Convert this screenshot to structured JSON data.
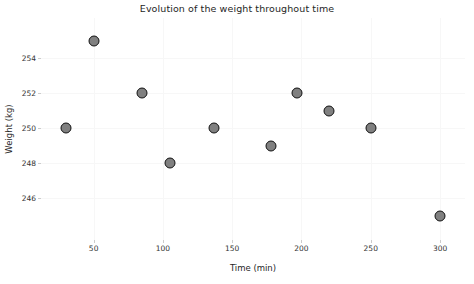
{
  "chart_data": {
    "type": "scatter",
    "title": "Evolution of the weight throughout time",
    "xlabel": "Time (min)",
    "ylabel": "Weight (kg)",
    "xlim": [
      12,
      318
    ],
    "ylim": [
      243.6,
      256.3
    ],
    "xticks": [
      50,
      100,
      150,
      200,
      250,
      300
    ],
    "xtick_labels": [
      "50",
      "100",
      "150",
      "200",
      "250",
      "300"
    ],
    "yticks": [
      246,
      248,
      250,
      252,
      254
    ],
    "ytick_labels": [
      "246",
      "248",
      "250",
      "252",
      "254"
    ],
    "grid": true,
    "legend": null,
    "x": [
      30,
      50,
      85,
      105,
      137,
      178,
      197,
      220,
      250,
      300
    ],
    "y": [
      250,
      255,
      252,
      248,
      250,
      249,
      252,
      251,
      250,
      245
    ],
    "points": [
      {
        "x": 30,
        "y": 250
      },
      {
        "x": 50,
        "y": 255
      },
      {
        "x": 85,
        "y": 252
      },
      {
        "x": 105,
        "y": 248
      },
      {
        "x": 137,
        "y": 250
      },
      {
        "x": 178,
        "y": 249
      },
      {
        "x": 197,
        "y": 252
      },
      {
        "x": 220,
        "y": 251
      },
      {
        "x": 250,
        "y": 250
      },
      {
        "x": 300,
        "y": 245
      }
    ],
    "marker": {
      "shape": "circle",
      "face_color": "#808080",
      "edge_color": "#111111",
      "size": 9
    },
    "colors": {
      "background": "#ffffff",
      "grid": "#f7f7f7",
      "text": "#262626",
      "tick_text": "#333333"
    }
  }
}
